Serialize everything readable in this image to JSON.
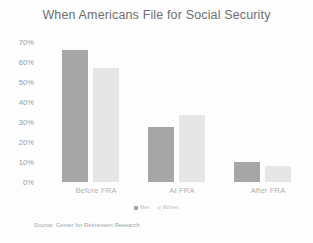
{
  "chart_data": {
    "type": "bar",
    "title": "When Americans File for Social Security",
    "categories": [
      "Before FRA",
      "At FRA",
      "After FRA"
    ],
    "series": [
      {
        "name": "Men",
        "color": "#a6a6a6",
        "values": [
          65,
          27,
          10
        ]
      },
      {
        "name": "Women",
        "color": "#e6e6e6",
        "values": [
          56,
          33,
          8
        ]
      }
    ],
    "xlabel": "",
    "ylabel": "",
    "ylim": [
      0,
      70
    ],
    "ytick_labels": [
      "70%",
      "60%",
      "50%",
      "40%",
      "30%",
      "20%",
      "10%",
      "0%"
    ],
    "ytick_values": [
      70,
      60,
      50,
      40,
      30,
      20,
      10,
      0
    ],
    "grid": false,
    "legend_position": "bottom",
    "value_format": "percent",
    "source_note": "Source: Center for Retirement Research"
  },
  "colors": {
    "men": "#a6a6a6",
    "women": "#e6e6e6",
    "title_text": "#6f6f6f",
    "axis_text": "#9a9a9a",
    "category_text": "#b0b0b0",
    "background": "#fdfdfd"
  }
}
